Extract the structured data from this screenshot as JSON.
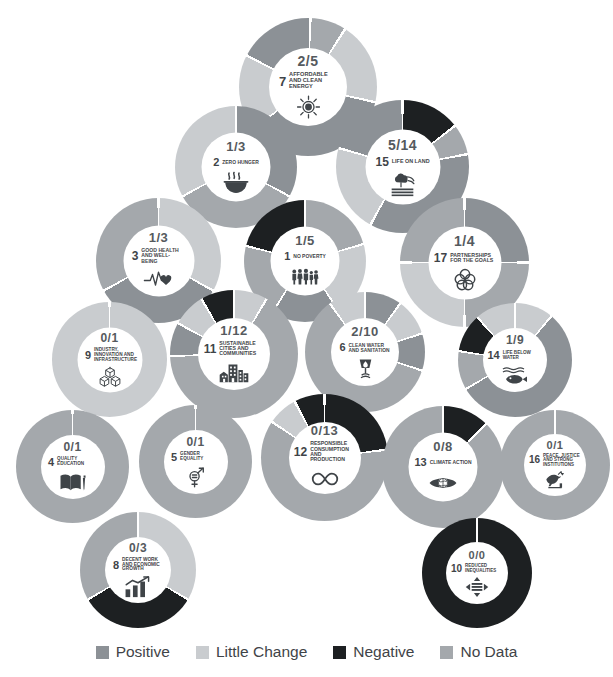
{
  "chart_data": {
    "type": "pie",
    "title": "",
    "legend_position": "bottom",
    "categories": [
      "Positive",
      "Little Change",
      "Negative",
      "No Data"
    ],
    "colors": {
      "positive": "#8c9196",
      "little_change": "#c9cccf",
      "negative": "#1d2022",
      "no_data": "#a4a8ac",
      "background": "#ffffff",
      "text": "#3f4448"
    },
    "series": [
      {
        "goal": "7",
        "name": "Affordable and Clean Energy",
        "fraction": "2/5",
        "values": {
          "positive": 2,
          "little_change": 2,
          "negative": 0,
          "no_data": 1
        },
        "total": 5
      },
      {
        "goal": "2",
        "name": "Zero Hunger",
        "fraction": "1/3",
        "values": {
          "positive": 1,
          "little_change": 1,
          "negative": 0,
          "no_data": 1
        },
        "total": 3
      },
      {
        "goal": "15",
        "name": "Life on Land",
        "fraction": "5/14",
        "values": {
          "positive": 5,
          "little_change": 6,
          "negative": 2,
          "no_data": 1
        },
        "total": 14
      },
      {
        "goal": "3",
        "name": "Good Health and Well-being",
        "fraction": "1/3",
        "values": {
          "positive": 1,
          "little_change": 1,
          "negative": 0,
          "no_data": 1
        },
        "total": 3
      },
      {
        "goal": "1",
        "name": "No Poverty",
        "fraction": "1/5",
        "values": {
          "positive": 1,
          "little_change": 2,
          "negative": 1,
          "no_data": 1
        },
        "total": 5
      },
      {
        "goal": "17",
        "name": "Partnerships for the Goals",
        "fraction": "1/4",
        "values": {
          "positive": 1,
          "little_change": 1,
          "negative": 0,
          "no_data": 2
        },
        "total": 4
      },
      {
        "goal": "11",
        "name": "Sustainable Cities and Communities",
        "fraction": "1/12",
        "values": {
          "positive": 1,
          "little_change": 2,
          "negative": 1,
          "no_data": 8
        },
        "total": 12
      },
      {
        "goal": "6",
        "name": "Clean Water and Sanitation",
        "fraction": "2/10",
        "values": {
          "positive": 2,
          "little_change": 2,
          "negative": 0,
          "no_data": 6
        },
        "total": 10
      },
      {
        "goal": "9",
        "name": "Industry, Innovation and Infrastructure",
        "fraction": "0/1",
        "values": {
          "positive": 0,
          "little_change": 1,
          "negative": 0,
          "no_data": 0
        },
        "total": 1
      },
      {
        "goal": "14",
        "name": "Life Below Water",
        "fraction": "1/9",
        "values": {
          "positive": 1,
          "little_change": 1,
          "negative": 1,
          "no_data": 6
        },
        "total": 9
      },
      {
        "goal": "4",
        "name": "Quality Education",
        "fraction": "0/1",
        "values": {
          "positive": 0,
          "little_change": 0,
          "negative": 0,
          "no_data": 1
        },
        "total": 1
      },
      {
        "goal": "5",
        "name": "Gender Equality",
        "fraction": "0/1",
        "values": {
          "positive": 0,
          "little_change": 0,
          "negative": 0,
          "no_data": 1
        },
        "total": 1
      },
      {
        "goal": "12",
        "name": "Responsible Consumption and Production",
        "fraction": "0/13",
        "values": {
          "positive": 0,
          "little_change": 1,
          "negative": 3,
          "no_data": 9
        },
        "total": 13
      },
      {
        "goal": "13",
        "name": "Climate Action",
        "fraction": "0/8",
        "values": {
          "positive": 0,
          "little_change": 0,
          "negative": 1,
          "no_data": 7
        },
        "total": 8
      },
      {
        "goal": "16",
        "name": "Peace, Justice and Strong Institutions",
        "fraction": "0/1",
        "values": {
          "positive": 0,
          "little_change": 0,
          "negative": 0,
          "no_data": 1
        },
        "total": 1
      },
      {
        "goal": "8",
        "name": "Decent Work and Economic Growth",
        "fraction": "0/3",
        "values": {
          "positive": 0,
          "little_change": 1,
          "negative": 1,
          "no_data": 1
        },
        "total": 3
      },
      {
        "goal": "10",
        "name": "Reduced Inequalities",
        "fraction": "0/0",
        "values": {
          "positive": 0,
          "little_change": 0,
          "negative": 1,
          "no_data": 0
        },
        "total": 0
      }
    ]
  },
  "goals": [
    {
      "id": "7",
      "num": "7",
      "fraction": "2/5",
      "name": "AFFORDABLE AND CLEAN ENERGY",
      "icon": "sun-icon",
      "x": 239,
      "y": 18,
      "size": 138,
      "hole": 0.565,
      "segments": [
        [
          "no_data",
          0.085
        ],
        [
          "little_change",
          0.195
        ],
        [
          "positive",
          0.36
        ],
        [
          "little_change",
          0.18
        ],
        [
          "positive",
          0.18
        ]
      ],
      "rot": -88
    },
    {
      "id": "2",
      "num": "2",
      "fraction": "1/3",
      "name": "ZERO HUNGER",
      "icon": "bowl-icon",
      "x": 175,
      "y": 106,
      "size": 122,
      "hole": 0.565,
      "segments": [
        [
          "positive",
          0.33
        ],
        [
          "no_data",
          0.34
        ],
        [
          "little_change",
          0.33
        ]
      ],
      "rot": -90
    },
    {
      "id": "15",
      "num": "15",
      "fraction": "5/14",
      "name": "LIFE ON LAND",
      "icon": "tree-icon",
      "x": 336,
      "y": 100,
      "size": 133,
      "hole": 0.565,
      "segments": [
        [
          "negative",
          0.145
        ],
        [
          "no_data",
          0.075
        ],
        [
          "positive",
          0.36
        ],
        [
          "little_change",
          0.215
        ],
        [
          "positive",
          0.205
        ]
      ],
      "rot": -90
    },
    {
      "id": "3",
      "num": "3",
      "fraction": "1/3",
      "name": "GOOD HEALTH AND WELL-BEING",
      "icon": "heartbeat-icon",
      "x": 96,
      "y": 198,
      "size": 125,
      "hole": 0.565,
      "segments": [
        [
          "little_change",
          0.33
        ],
        [
          "positive",
          0.34
        ],
        [
          "no_data",
          0.33
        ]
      ],
      "rot": -90
    },
    {
      "id": "1",
      "num": "1",
      "fraction": "1/5",
      "name": "NO POVERTY",
      "icon": "family-icon",
      "x": 244,
      "y": 200,
      "size": 122,
      "hole": 0.565,
      "segments": [
        [
          "no_data",
          0.205
        ],
        [
          "little_change",
          0.2
        ],
        [
          "positive",
          0.185
        ],
        [
          "no_data",
          0.2
        ],
        [
          "negative",
          0.21
        ]
      ],
      "rot": -90
    },
    {
      "id": "17",
      "num": "17",
      "fraction": "1/4",
      "name": "PARTNERSHIPS FOR THE GOALS",
      "icon": "circles-icon",
      "x": 400,
      "y": 198,
      "size": 129,
      "hole": 0.565,
      "segments": [
        [
          "positive",
          0.25
        ],
        [
          "no_data",
          0.25
        ],
        [
          "little_change",
          0.25
        ],
        [
          "no_data",
          0.25
        ]
      ],
      "rot": -90
    },
    {
      "id": "11",
      "num": "11",
      "fraction": "1/12",
      "name": "SUSTAINABLE CITIES AND COMMUNITIES",
      "icon": "city-icon",
      "x": 170,
      "y": 290,
      "size": 128,
      "hole": 0.565,
      "segments": [
        [
          "little_change",
          0.085
        ],
        [
          "no_data",
          0.66
        ],
        [
          "positive",
          0.085
        ],
        [
          "little_change",
          0.085
        ],
        [
          "negative",
          0.085
        ]
      ],
      "rot": -90
    },
    {
      "id": "6",
      "num": "6",
      "fraction": "2/10",
      "name": "CLEAN WATER AND SANITATION",
      "icon": "water-icon",
      "x": 305,
      "y": 292,
      "size": 120,
      "hole": 0.565,
      "segments": [
        [
          "positive",
          0.1
        ],
        [
          "little_change",
          0.1
        ],
        [
          "positive",
          0.1
        ],
        [
          "no_data",
          0.6
        ],
        [
          "little_change",
          0.1
        ]
      ],
      "rot": -90
    },
    {
      "id": "9",
      "num": "9",
      "fraction": "0/1",
      "name": "INDUSTRY, INNOVATION AND INFRASTRUCTURE",
      "icon": "boxes-icon",
      "x": 52,
      "y": 302,
      "size": 115,
      "hole": 0.565,
      "segments": [
        [
          "little_change",
          1.0
        ]
      ],
      "rot": -90
    },
    {
      "id": "14",
      "num": "14",
      "fraction": "1/9",
      "name": "LIFE BELOW WATER",
      "icon": "fish-icon",
      "x": 458,
      "y": 303,
      "size": 114,
      "hole": 0.565,
      "segments": [
        [
          "little_change",
          0.11
        ],
        [
          "positive",
          0.555
        ],
        [
          "no_data",
          0.11
        ],
        [
          "negative",
          0.11
        ],
        [
          "little_change",
          0.115
        ]
      ],
      "rot": -90
    },
    {
      "id": "4",
      "num": "4",
      "fraction": "0/1",
      "name": "QUALITY EDUCATION",
      "icon": "book-icon",
      "x": 16,
      "y": 410,
      "size": 113,
      "hole": 0.565,
      "segments": [
        [
          "no_data",
          1.0
        ]
      ],
      "rot": -90
    },
    {
      "id": "5",
      "num": "5",
      "fraction": "0/1",
      "name": "GENDER EQUALITY",
      "icon": "gender-icon",
      "x": 139,
      "y": 405,
      "size": 113,
      "hole": 0.565,
      "segments": [
        [
          "no_data",
          1.0
        ]
      ],
      "rot": -90
    },
    {
      "id": "12",
      "num": "12",
      "fraction": "0/13",
      "name": "RESPONSIBLE CONSUMPTION AND PRODUCTION",
      "icon": "infinity-icon",
      "x": 261,
      "y": 394,
      "size": 127,
      "hole": 0.565,
      "segments": [
        [
          "negative",
          0.23
        ],
        [
          "no_data",
          0.615
        ],
        [
          "little_change",
          0.077
        ],
        [
          "negative",
          0.078
        ]
      ],
      "rot": -90
    },
    {
      "id": "13",
      "num": "13",
      "fraction": "0/8",
      "name": "CLIMATE ACTION",
      "icon": "eye-earth-icon",
      "x": 382,
      "y": 406,
      "size": 122,
      "hole": 0.565,
      "segments": [
        [
          "negative",
          0.125
        ],
        [
          "no_data",
          0.875
        ]
      ],
      "rot": -90
    },
    {
      "id": "16",
      "num": "16",
      "fraction": "0/1",
      "name": "PEACE, JUSTICE AND STRONG INSTITUTIONS",
      "icon": "dove-icon",
      "x": 500,
      "y": 410,
      "size": 110,
      "hole": 0.565,
      "segments": [
        [
          "no_data",
          1.0
        ]
      ],
      "rot": -90
    },
    {
      "id": "8",
      "num": "8",
      "fraction": "0/3",
      "name": "DECENT WORK AND ECONOMIC GROWTH",
      "icon": "chart-icon",
      "x": 80,
      "y": 512,
      "size": 116,
      "hole": 0.565,
      "segments": [
        [
          "little_change",
          0.335
        ],
        [
          "negative",
          0.33
        ],
        [
          "no_data",
          0.335
        ]
      ],
      "rot": -90
    },
    {
      "id": "10",
      "num": "10",
      "fraction": "0/0",
      "name": "REDUCED INEQUALITIES",
      "icon": "arrows-icon",
      "x": 422,
      "y": 518,
      "size": 110,
      "hole": 0.565,
      "segments": [
        [
          "negative",
          1.0
        ]
      ],
      "rot": -90
    }
  ],
  "legend": {
    "items": [
      {
        "label": "Positive",
        "color": "#8c9196",
        "key": "positive"
      },
      {
        "label": "Little Change",
        "color": "#c9cccf",
        "key": "little_change"
      },
      {
        "label": "Negative",
        "color": "#1d2022",
        "key": "negative"
      },
      {
        "label": "No Data",
        "color": "#a4a8ac",
        "key": "no_data"
      }
    ]
  }
}
